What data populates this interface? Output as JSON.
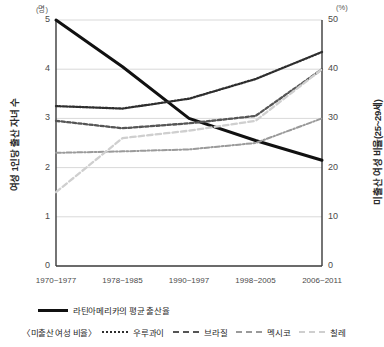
{
  "chart_data": {
    "type": "line",
    "title": "",
    "categories": [
      "1970~1977",
      "1978~1985",
      "1990~1997",
      "1998~2005",
      "2006~2011"
    ],
    "xlabel": "",
    "left_axis": {
      "label": "여성 1인당 출산 자녀 수",
      "unit": "(명)",
      "ticks": [
        0,
        1,
        2,
        3,
        4,
        5
      ],
      "ylim": [
        0,
        5
      ]
    },
    "right_axis": {
      "label": "미출산 여성 비율(25~29세)",
      "unit": "(%)",
      "ticks": [
        0,
        10,
        20,
        30,
        40,
        50
      ],
      "ylim": [
        0,
        50
      ]
    },
    "grid": true,
    "legend_position": "bottom",
    "series": [
      {
        "name": "라틴아메리카의 평균 출산율",
        "axis": "left",
        "style": "solid",
        "color": "#111111",
        "values": [
          5.0,
          4.05,
          3.0,
          2.55,
          2.15
        ]
      },
      {
        "name": "우루과이",
        "axis": "right",
        "style": "dotted",
        "color": "#2e2e2e",
        "values": [
          32.5,
          32.0,
          34.0,
          38.0,
          43.5
        ]
      },
      {
        "name": "브라질",
        "axis": "right",
        "style": "dashed",
        "color": "#555555",
        "values": [
          29.5,
          28.0,
          29.0,
          30.5,
          40.0
        ]
      },
      {
        "name": "멕시코",
        "axis": "right",
        "style": "dashdot",
        "color": "#9a9a9a",
        "values": [
          23.0,
          23.3,
          23.7,
          25.0,
          30.0
        ]
      },
      {
        "name": "칠레",
        "axis": "right",
        "style": "longdash",
        "color": "#cfcfcf",
        "values": [
          15.0,
          26.0,
          27.5,
          29.5,
          40.0
        ]
      }
    ]
  },
  "axes": {
    "left_unit": "(명)",
    "right_unit": "(%)",
    "left_title": "여성 1인당 출산 자녀 수",
    "right_title": "미출산 여성 비율(25~29세)",
    "left_ticks": [
      "5",
      "4",
      "3",
      "2",
      "1",
      "0"
    ],
    "right_ticks": [
      "50",
      "40",
      "30",
      "20",
      "10",
      "0"
    ],
    "x_ticks": [
      "1970~1977",
      "1978~1985",
      "1990~1997",
      "1998~2005",
      "2006~2011"
    ]
  },
  "legend": {
    "primary_label": "라틴아메리카의 평균 출산율",
    "group_prefix": "〈미출산 여성 비율〉",
    "items": [
      {
        "label": "우루과이"
      },
      {
        "label": "브라질"
      },
      {
        "label": "멕시코"
      },
      {
        "label": "칠레"
      }
    ]
  }
}
